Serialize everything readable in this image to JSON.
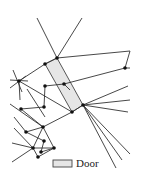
{
  "legend": {
    "door_label": "Door",
    "door_fill": "#e6e6e6"
  },
  "door": {
    "points": [
      [
        45,
        64
      ],
      [
        57,
        58
      ],
      [
        83,
        105
      ],
      [
        72,
        112
      ]
    ]
  },
  "nodes": [
    [
      57,
      58
    ],
    [
      45,
      64
    ],
    [
      19,
      81
    ],
    [
      45,
      86
    ],
    [
      64,
      84
    ],
    [
      125,
      68
    ],
    [
      72,
      112
    ],
    [
      83,
      105
    ],
    [
      21,
      109
    ],
    [
      44,
      107
    ],
    [
      43,
      127
    ],
    [
      26,
      132
    ],
    [
      44,
      141
    ],
    [
      33,
      148
    ],
    [
      41,
      152
    ],
    [
      54,
      148
    ],
    [
      38,
      157
    ]
  ],
  "edges": [
    [
      [
        37,
        18
      ],
      [
        57,
        58
      ]
    ],
    [
      [
        82,
        18
      ],
      [
        57,
        58
      ]
    ],
    [
      [
        57,
        58
      ],
      [
        130,
        51
      ]
    ],
    [
      [
        130,
        51
      ],
      [
        125,
        68
      ]
    ],
    [
      [
        125,
        68
      ],
      [
        130,
        68
      ]
    ],
    [
      [
        64,
        84
      ],
      [
        125,
        68
      ]
    ],
    [
      [
        45,
        86
      ],
      [
        64,
        84
      ]
    ],
    [
      [
        64,
        84
      ],
      [
        70,
        90
      ]
    ],
    [
      [
        45,
        64
      ],
      [
        57,
        58
      ]
    ],
    [
      [
        19,
        81
      ],
      [
        45,
        64
      ]
    ],
    [
      [
        13,
        70
      ],
      [
        22,
        92
      ]
    ],
    [
      [
        10,
        80
      ],
      [
        28,
        81
      ]
    ],
    [
      [
        10,
        88
      ],
      [
        26,
        76
      ]
    ],
    [
      [
        19,
        81
      ],
      [
        72,
        112
      ]
    ],
    [
      [
        72,
        112
      ],
      [
        83,
        105
      ]
    ],
    [
      [
        83,
        105
      ],
      [
        128,
        86
      ]
    ],
    [
      [
        83,
        105
      ],
      [
        130,
        100
      ]
    ],
    [
      [
        83,
        105
      ],
      [
        128,
        112
      ]
    ],
    [
      [
        83,
        105
      ],
      [
        130,
        154
      ]
    ],
    [
      [
        83,
        105
      ],
      [
        122,
        160
      ]
    ],
    [
      [
        83,
        105
      ],
      [
        116,
        168
      ]
    ],
    [
      [
        45,
        86
      ],
      [
        44,
        107
      ]
    ],
    [
      [
        44,
        107
      ],
      [
        21,
        109
      ]
    ],
    [
      [
        21,
        109
      ],
      [
        43,
        127
      ]
    ],
    [
      [
        10,
        104
      ],
      [
        43,
        127
      ]
    ],
    [
      [
        43,
        127
      ],
      [
        72,
        112
      ]
    ],
    [
      [
        43,
        127
      ],
      [
        26,
        132
      ]
    ],
    [
      [
        14,
        117
      ],
      [
        26,
        132
      ]
    ],
    [
      [
        26,
        132
      ],
      [
        44,
        141
      ]
    ],
    [
      [
        43,
        127
      ],
      [
        33,
        148
      ]
    ],
    [
      [
        43,
        127
      ],
      [
        54,
        148
      ]
    ],
    [
      [
        14,
        128
      ],
      [
        33,
        148
      ]
    ],
    [
      [
        12,
        143
      ],
      [
        33,
        148
      ]
    ],
    [
      [
        33,
        148
      ],
      [
        38,
        157
      ]
    ],
    [
      [
        44,
        141
      ],
      [
        41,
        152
      ]
    ],
    [
      [
        41,
        152
      ],
      [
        54,
        148
      ]
    ],
    [
      [
        33,
        148
      ],
      [
        54,
        148
      ]
    ],
    [
      [
        54,
        148
      ],
      [
        38,
        157
      ]
    ],
    [
      [
        12,
        162
      ],
      [
        33,
        148
      ]
    ],
    [
      [
        19,
        81
      ],
      [
        20,
        100
      ]
    ],
    [
      [
        27,
        89
      ],
      [
        45,
        117
      ]
    ]
  ]
}
